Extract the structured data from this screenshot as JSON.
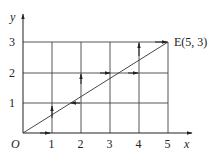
{
  "diagram": {
    "axes": {
      "x_label": "x",
      "y_label": "y",
      "origin_label": "O",
      "x_ticks": [
        "1",
        "2",
        "3",
        "4",
        "5"
      ],
      "y_ticks": [
        "1",
        "2",
        "3"
      ]
    },
    "point_label": "E(5, 3)",
    "point": {
      "x": 5,
      "y": 3
    },
    "grid": {
      "x_max": 5,
      "y_max": 3
    },
    "line_color": "#333333"
  }
}
